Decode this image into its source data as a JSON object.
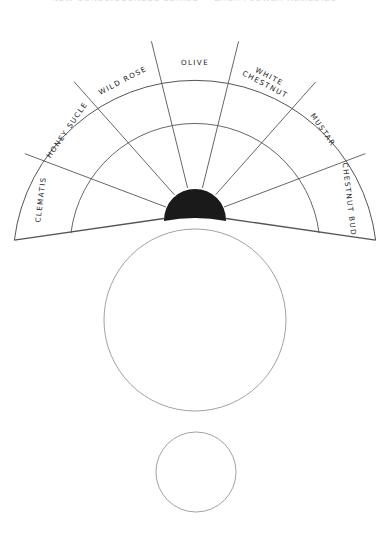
{
  "header": {
    "text": "NEW CONSCIOUSNESS SERIES — BACH FLOWER REMEDIES"
  },
  "diagram": {
    "stroke_color": "#555555",
    "fill_dark": "#1a1a1a",
    "fan": {
      "center": [
        195,
        218
      ],
      "outer_radius": 182,
      "inner_ring_radius": 125,
      "hub_radius": 31,
      "start_angle_deg": 187,
      "end_angle_deg": -7,
      "segments": [
        {
          "label": "CLEMATIS",
          "lines": [
            "CLEMATIS"
          ]
        },
        {
          "label": "HONEY SUCLE",
          "lines": [
            "HONEY SUCLE"
          ]
        },
        {
          "label": "WILD ROSE",
          "lines": [
            "WILD  ROSE"
          ]
        },
        {
          "label": "OLIVE",
          "lines": [
            "OLIVE"
          ]
        },
        {
          "label": "WHITE CHESTNUT",
          "lines": [
            "WHITE",
            "CHESTNUT"
          ]
        },
        {
          "label": "MUSTAR",
          "lines": [
            "MUSTAR"
          ]
        },
        {
          "label": "CHESTNUT BUD",
          "lines": [
            "CHESTNUT  BUD"
          ]
        }
      ]
    },
    "large_circle": {
      "center": [
        195,
        320
      ],
      "radius": 91
    },
    "small_circle": {
      "center": [
        196,
        472
      ],
      "radius": 40
    }
  }
}
